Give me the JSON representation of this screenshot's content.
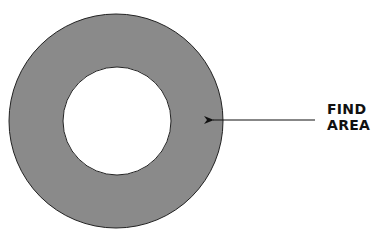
{
  "diagram": {
    "type": "annulus",
    "outer_circle": {
      "cx": 116,
      "cy": 121,
      "r": 107
    },
    "inner_circle": {
      "cx": 117,
      "cy": 121,
      "r": 54
    },
    "fill_color": "#8a8a8a",
    "stroke_color": "#222222",
    "arrow": {
      "x1": 315,
      "y1": 120,
      "x2": 212,
      "y2": 120
    }
  },
  "label": {
    "line1": "FIND",
    "line2": "AREA"
  }
}
